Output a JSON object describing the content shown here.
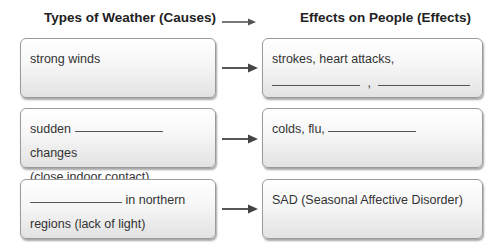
{
  "headers": {
    "causes": "Types of Weather (Causes)",
    "effects": "Effects on People (Effects)"
  },
  "rows": [
    {
      "cause": {
        "line1": "strong winds"
      },
      "effect": {
        "line1": "strokes, heart attacks,",
        "separator": ","
      }
    },
    {
      "cause": {
        "prefix": "sudden",
        "suffix": "changes",
        "line2": "(close indoor contact)"
      },
      "effect": {
        "line1": "colds, flu,"
      }
    },
    {
      "cause": {
        "suffix": "in northern",
        "line2": "regions (lack of light)"
      },
      "effect": {
        "line1": "SAD (Seasonal Affective Disorder)"
      }
    }
  ],
  "icons": {
    "arrow": "right-arrow-icon"
  },
  "colors": {
    "box_border": "#9a9a9a",
    "arrow": "#444444",
    "text": "#333333"
  }
}
